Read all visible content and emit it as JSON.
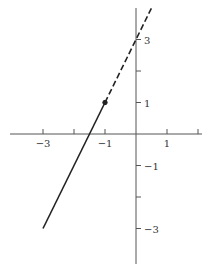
{
  "chart_data": {
    "type": "line",
    "title": "",
    "xlabel": "",
    "ylabel": "",
    "xlim": [
      -4,
      2
    ],
    "ylim": [
      -4,
      4.2
    ],
    "grid": false,
    "legend": null,
    "x_ticks": [
      -3,
      -2,
      -1,
      1,
      2
    ],
    "x_tick_labels": [
      {
        "value": -3,
        "label": "−3"
      },
      {
        "value": -1,
        "label": "−1"
      },
      {
        "value": 1,
        "label": "1"
      }
    ],
    "y_ticks": [
      3,
      2,
      1,
      -1,
      -2,
      -3
    ],
    "y_tick_labels": [
      {
        "value": 3,
        "label": "3"
      },
      {
        "value": 1,
        "label": "1"
      },
      {
        "value": -1,
        "label": "−1"
      },
      {
        "value": -3,
        "label": "−3"
      }
    ],
    "series": [
      {
        "name": "solid segment",
        "style": "solid",
        "x": [
          -3,
          -1
        ],
        "y": [
          -3,
          1
        ]
      },
      {
        "name": "dashed segment",
        "style": "dashed",
        "x": [
          -1,
          0.5
        ],
        "y": [
          1,
          4
        ]
      }
    ],
    "points": [
      {
        "name": "endpoint",
        "x": -1,
        "y": 1,
        "filled": true
      }
    ],
    "equation_hint": "y = 2x + 3"
  },
  "colors": {
    "axis": "#555555",
    "line": "#222222",
    "label": "#333333"
  }
}
